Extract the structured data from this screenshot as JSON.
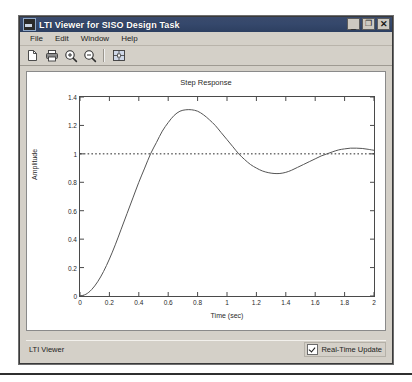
{
  "window": {
    "title": "LTI Viewer for SISO Design Task",
    "icon": "app-icon",
    "buttons": {
      "minimize": "_",
      "maximize": "❐",
      "close": "✕"
    }
  },
  "menubar": {
    "items": [
      {
        "label": "File"
      },
      {
        "label": "Edit"
      },
      {
        "label": "Window"
      },
      {
        "label": "Help"
      }
    ]
  },
  "toolbar": {
    "items": [
      {
        "name": "new-page-icon",
        "tip": "New"
      },
      {
        "name": "print-icon",
        "tip": "Print"
      },
      {
        "name": "zoom-in-icon",
        "tip": "Zoom In"
      },
      {
        "name": "zoom-out-icon",
        "tip": "Zoom Out"
      },
      {
        "name": "separator",
        "tip": ""
      },
      {
        "name": "grid-fit-icon",
        "tip": "Fit to View"
      }
    ]
  },
  "statusbar": {
    "text": "LTI Viewer",
    "realtime_label": "Real-Time Update",
    "realtime_checked": true
  },
  "colors": {
    "titlebar": "#2d3f60",
    "face": "#d4d0c8",
    "plot_line": "#4a4a4a",
    "reference_line": "#2a2a2a",
    "plot_bg": "#ffffff"
  },
  "chart_data": {
    "type": "line",
    "title": "Step Response",
    "xlabel": "Time (sec)",
    "ylabel": "Amplitude",
    "xlim": [
      0,
      2
    ],
    "ylim": [
      0,
      1.4
    ],
    "xticks": [
      0,
      0.2,
      0.4,
      0.6,
      0.8,
      1,
      1.2,
      1.4,
      1.6,
      1.8,
      2
    ],
    "xticklabels": [
      "0",
      "0.2",
      "0.4",
      "0.6",
      "0.8",
      "1",
      "1.2",
      "1.4",
      "1.6",
      "1.8",
      "2"
    ],
    "yticks": [
      0,
      0.2,
      0.4,
      0.6,
      0.8,
      1,
      1.2,
      1.4
    ],
    "yticklabels": [
      "0",
      "0.2",
      "0.4",
      "0.6",
      "0.8",
      "1",
      "1.2",
      "1.4"
    ],
    "grid": false,
    "legend": null,
    "annotations": [],
    "reference_lines": [
      {
        "name": "steady-state",
        "orientation": "horizontal",
        "y": 1.0,
        "style": "dotted"
      }
    ],
    "series": [
      {
        "name": "Step Response",
        "style": "solid",
        "x": [
          0,
          0.04,
          0.08,
          0.12,
          0.16,
          0.2,
          0.24,
          0.28,
          0.32,
          0.36,
          0.4,
          0.44,
          0.48,
          0.52,
          0.56,
          0.6,
          0.64,
          0.68,
          0.72,
          0.76,
          0.8,
          0.84,
          0.88,
          0.92,
          0.96,
          1.0,
          1.04,
          1.08,
          1.12,
          1.16,
          1.2,
          1.24,
          1.28,
          1.32,
          1.36,
          1.4,
          1.44,
          1.48,
          1.52,
          1.56,
          1.6,
          1.64,
          1.68,
          1.72,
          1.76,
          1.8,
          1.84,
          1.88,
          1.92,
          1.96,
          2.0
        ],
        "y": [
          0,
          0.012,
          0.046,
          0.1,
          0.172,
          0.26,
          0.36,
          0.47,
          0.58,
          0.69,
          0.8,
          0.9,
          1.0,
          1.08,
          1.16,
          1.22,
          1.27,
          1.3,
          1.31,
          1.31,
          1.3,
          1.275,
          1.24,
          1.2,
          1.15,
          1.1,
          1.05,
          1.0,
          0.96,
          0.925,
          0.9,
          0.88,
          0.868,
          0.862,
          0.862,
          0.87,
          0.885,
          0.905,
          0.925,
          0.945,
          0.965,
          0.985,
          1.0,
          1.015,
          1.028,
          1.035,
          1.04,
          1.04,
          1.038,
          1.032,
          1.025
        ]
      }
    ]
  }
}
